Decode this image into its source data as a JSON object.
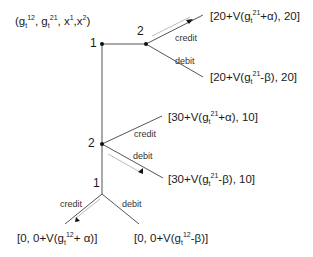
{
  "header": {
    "state_tuple": "(g_t^12, g_t^21, x^1, x^2)",
    "state_parts": {
      "open": "(g",
      "sub1": "t",
      "sup1": "12",
      "mid1": ", g",
      "sub2": "t",
      "sup2": "21",
      "mid2": ", x",
      "sup3": "1",
      "mid3": ",x",
      "sup4": "2",
      "close": ")"
    }
  },
  "nodes": {
    "root_player": "1",
    "upper_player2": "2",
    "lower_player2": "2",
    "bottom_player1": "1"
  },
  "edges": {
    "upper_credit": "credit",
    "upper_debit": "debit",
    "lower_credit": "credit",
    "lower_debit": "debit",
    "bottom_credit": "credit",
    "bottom_debit": "debit"
  },
  "payoffs": {
    "p1": {
      "pre": "[20+V(g",
      "sub": "t",
      "sup": "21",
      "post": "+α), 20]",
      "full": "[20+V(g_t^21+α), 20]"
    },
    "p2": {
      "pre": "[20+V(g",
      "sub": "t",
      "sup": "21",
      "post": "-β), 20]",
      "full": "[20+V(g_t^21-β), 20]"
    },
    "p3": {
      "pre": "[30+V(g",
      "sub": "t",
      "sup": "21",
      "post": "+α), 10]",
      "full": "[30+V(g_t^21+α), 10]"
    },
    "p4": {
      "pre": "[30+V(g",
      "sub": "t",
      "sup": "21",
      "post": "-β), 10]",
      "full": "[30+V(g_t^21-β), 10]"
    },
    "p5": {
      "pre": "[0, 0+V(g",
      "sub": "t",
      "sup": "12",
      "post": "+ α)]",
      "full": "[0, 0+V(g_t^12+ α)]"
    },
    "p6": {
      "pre": "[0, 0+V(g",
      "sub": "t",
      "sup": "12",
      "post": "-β)]",
      "full": "[0, 0+V(g_t^12-β)]"
    }
  },
  "colors": {
    "line": "#555555",
    "node": "#111111",
    "arrow": "#111111",
    "arrow_line": "#bbbbbb"
  }
}
